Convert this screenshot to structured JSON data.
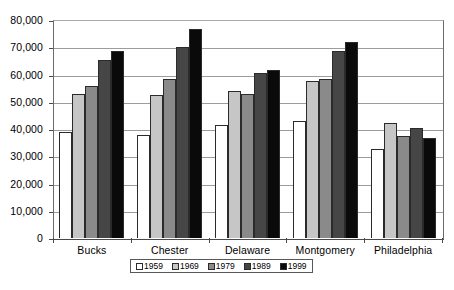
{
  "chart_data": {
    "type": "bar",
    "title": "",
    "subtitle": "",
    "xlabel": "",
    "ylabel": "",
    "ylim": [
      0,
      80000
    ],
    "ytick_step": 10000,
    "ytick_labels": [
      "0",
      "10,000",
      "20,000",
      "30,000",
      "40,000",
      "50,000",
      "60,000",
      "70,000",
      "80,000"
    ],
    "ytick_values": [
      0,
      10000,
      20000,
      30000,
      40000,
      50000,
      60000,
      70000,
      80000
    ],
    "grid": true,
    "grid_axis": "y",
    "legend_position": "bottom-center",
    "categories": [
      "Bucks",
      "Chester",
      "Delaware",
      "Montgomery",
      "Philadelphia"
    ],
    "series": [
      {
        "name": "1959",
        "color": "#ffffff",
        "values": [
          39000,
          37800,
          41500,
          43000,
          32800
        ]
      },
      {
        "name": "1969",
        "color": "#c6c6c6",
        "values": [
          52800,
          52400,
          53800,
          57500,
          42200
        ]
      },
      {
        "name": "1979",
        "color": "#8a8a8a",
        "values": [
          55800,
          58500,
          53000,
          58500,
          37500
        ]
      },
      {
        "name": "1989",
        "color": "#464646",
        "values": [
          65500,
          70200,
          60500,
          68500,
          40200
        ]
      },
      {
        "name": "1999",
        "color": "#0a0a0a",
        "values": [
          68500,
          76800,
          61800,
          71800,
          36800
        ]
      }
    ]
  },
  "style": {
    "plot_background": "#ffffff",
    "gridline_color": "#9c9c9c",
    "axis_color": "#4a4a4a",
    "bar_outline": "#2b2b2b",
    "legend_border": "#585858"
  }
}
